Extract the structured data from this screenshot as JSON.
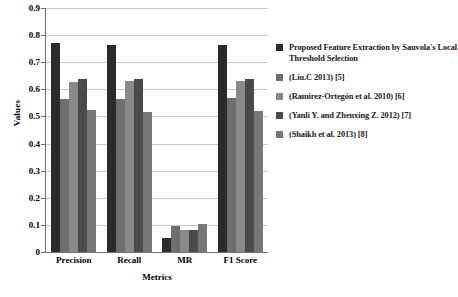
{
  "chart_data": {
    "type": "bar",
    "title": "",
    "xlabel": "Metrics",
    "ylabel": "Values",
    "categories": [
      "Precision",
      "Recall",
      "MR",
      "F1 Score"
    ],
    "ylim": [
      0,
      0.9
    ],
    "yticks": [
      "0",
      "0.1",
      "0.2",
      "0.3",
      "0.4",
      "0.5",
      "0.6",
      "0.7",
      "0.8",
      "0.9"
    ],
    "grid": true,
    "legend_position": "right",
    "series": [
      {
        "name": "Proposed Feature Extraction by Sauvola's Local Threshold Selection",
        "color": "#2b2b2b",
        "values": [
          0.77,
          0.765,
          0.053,
          0.763
        ]
      },
      {
        "name": "(Liu.C 2013) [5]",
        "color": "#6e6e6e",
        "values": [
          0.563,
          0.566,
          0.097,
          0.568
        ]
      },
      {
        "name": "(Ramírez-Ortegón et al. 2010) [6]",
        "color": "#8a8a8a",
        "values": [
          0.627,
          0.631,
          0.08,
          0.63
        ]
      },
      {
        "name": "(Yanli Y. and Zhenxing Z. 2012) [7]",
        "color": "#4a4a4a",
        "values": [
          0.639,
          0.638,
          0.08,
          0.64
        ]
      },
      {
        "name": "(Shaikh et al. 2013) [8]",
        "color": "#767676",
        "values": [
          0.524,
          0.516,
          0.105,
          0.521
        ]
      }
    ]
  }
}
